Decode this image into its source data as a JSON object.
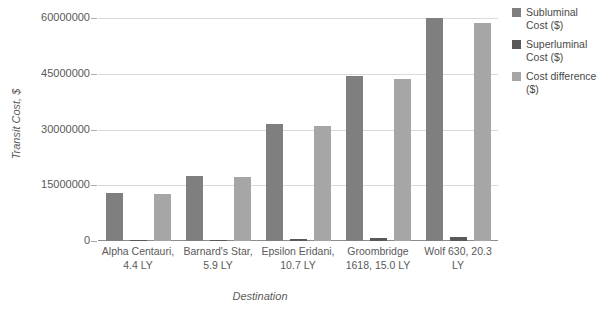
{
  "chart_data": {
    "type": "bar",
    "title": "",
    "xlabel": "Destination",
    "ylabel": "Transit Cost, $",
    "ylim": [
      0,
      60000000
    ],
    "grid": true,
    "legend_position": "right",
    "ytick_labels": [
      "60000000",
      "45000000",
      "30000000",
      "15000000",
      "0"
    ],
    "ytick_values": [
      60000000,
      45000000,
      30000000,
      15000000,
      0
    ],
    "categories": [
      "Alpha Centauri, 4.4 LY",
      "Barnard's Star, 5.9 LY",
      "Epsilon Eridani, 10.7 LY",
      "Groombridge 1618, 15.0 LY",
      "Wolf 630, 20.3 LY"
    ],
    "series": [
      {
        "name": "Subluminal Cost ($)",
        "color": "#7f7f7f",
        "values": [
          12800000,
          17500000,
          31500000,
          44500000,
          59900000
        ]
      },
      {
        "name": "Superluminal Cost ($)",
        "color": "#595959",
        "values": [
          200000,
          300000,
          500000,
          800000,
          1100000
        ]
      },
      {
        "name": "Cost difference ($)",
        "color": "#a6a6a6",
        "values": [
          12700000,
          17100000,
          31000000,
          43600000,
          58700000
        ]
      }
    ]
  },
  "axis": {
    "y_title": "Transit Cost, $",
    "x_title": "Destination"
  },
  "legend": {
    "items": [
      {
        "label": "Subluminal Cost ($)",
        "color": "#7f7f7f"
      },
      {
        "label": "Superluminal Cost ($)",
        "color": "#595959"
      },
      {
        "label": "Cost difference ($)",
        "color": "#a6a6a6"
      }
    ]
  },
  "colors": {
    "gridline": "#d9d9d9",
    "axis": "#8c8c8c",
    "text": "#595959",
    "background": "#ffffff"
  }
}
